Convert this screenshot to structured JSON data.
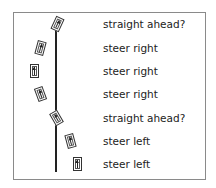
{
  "diagram": {
    "title": "",
    "rows": [
      {
        "label": "straight ahead?",
        "car_x": 57,
        "car_y": 24,
        "rotation_deg": 25
      },
      {
        "label": "steer right",
        "car_x": 40,
        "car_y": 48,
        "rotation_deg": 15
      },
      {
        "label": "steer right",
        "car_x": 34,
        "car_y": 71,
        "rotation_deg": 0
      },
      {
        "label": "steer right",
        "car_x": 40,
        "car_y": 94,
        "rotation_deg": -20
      },
      {
        "label": "straight ahead?",
        "car_x": 56,
        "car_y": 118,
        "rotation_deg": -30
      },
      {
        "label": "steer left",
        "car_x": 70,
        "car_y": 141,
        "rotation_deg": -15
      },
      {
        "label": "steer left",
        "car_x": 77,
        "car_y": 164,
        "rotation_deg": 0
      }
    ],
    "colors": {
      "border": "#8a8a8a",
      "line": "#222222",
      "text": "#222222"
    }
  }
}
